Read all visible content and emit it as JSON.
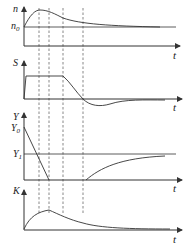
{
  "diagram": {
    "panels": [
      {
        "id": "n",
        "y_label": "n",
        "ref_label": "n",
        "ref_sub": "0",
        "x_label": "t"
      },
      {
        "id": "S",
        "y_label": "S",
        "x_label": "t"
      },
      {
        "id": "Y",
        "y_label": "Y",
        "ref_label_top": "Y",
        "ref_sub_top": "0",
        "ref_label": "Y",
        "ref_sub": "1",
        "x_label": "t"
      },
      {
        "id": "K",
        "y_label": "K",
        "x_label": "t"
      }
    ],
    "line_color": "#333333",
    "dashed_marker_count": 4
  }
}
